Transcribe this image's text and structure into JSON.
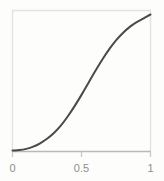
{
  "chart_data": {
    "type": "line",
    "title": "",
    "subtitle": "",
    "xlabel": "",
    "ylabel": "",
    "xlim": [
      0,
      1
    ],
    "ylim": [
      0,
      1
    ],
    "grid": false,
    "legend": null,
    "legend_position": "none",
    "xticks": [
      0,
      0.5,
      1
    ],
    "xtick_labels": [
      "0",
      "0.5",
      "1"
    ],
    "yticks": [],
    "ytick_labels": [],
    "series": [
      {
        "name": "sigmoid",
        "color": "#4a4a48",
        "linewidth": 2,
        "x": [
          0.0,
          0.05,
          0.1,
          0.15,
          0.2,
          0.25,
          0.3,
          0.35,
          0.4,
          0.45,
          0.5,
          0.55,
          0.6,
          0.65,
          0.7,
          0.75,
          0.8,
          0.85,
          0.9,
          0.95,
          1.0
        ],
        "values": [
          0.0,
          0.003,
          0.012,
          0.028,
          0.053,
          0.086,
          0.129,
          0.183,
          0.25,
          0.326,
          0.409,
          0.497,
          0.584,
          0.667,
          0.743,
          0.809,
          0.864,
          0.909,
          0.944,
          0.972,
          1.0
        ]
      }
    ],
    "annotations": []
  },
  "axes": {
    "frame_color": "#e2e2e0",
    "axis_color": "#b9b9b7",
    "tick_color": "#c9c9c7",
    "label_color": "#8e8e8c",
    "background": "#fdfdfc"
  },
  "labels": {
    "x_tick_0": "0",
    "x_tick_half": "0.5",
    "x_tick_1": "1"
  }
}
